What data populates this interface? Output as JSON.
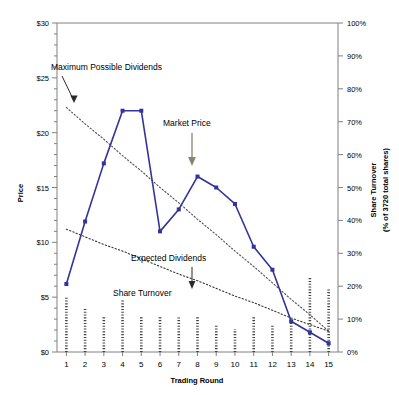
{
  "chart_data": {
    "type": "line",
    "title": "",
    "xlabel": "Trading Round",
    "ylabel": "Price",
    "y2label_line1": "Share Turnover",
    "y2label_line2": "(% of 3720 total shares)",
    "x": [
      1,
      2,
      3,
      4,
      5,
      6,
      7,
      8,
      9,
      10,
      11,
      12,
      13,
      14,
      15
    ],
    "xtick_labels": [
      "1",
      "2",
      "3",
      "4",
      "5",
      "6",
      "7",
      "8",
      "9",
      "10",
      "11",
      "12",
      "13",
      "14",
      "15"
    ],
    "ylim": [
      0,
      30
    ],
    "ytick_labels": [
      "$0",
      "$5",
      "$10",
      "$15",
      "$20",
      "$25",
      "$30"
    ],
    "ytick_values": [
      0,
      5,
      10,
      15,
      20,
      25,
      30
    ],
    "y_minor_step": 1,
    "y2lim": [
      0,
      100
    ],
    "y2tick_labels": [
      "0%",
      "10%",
      "20%",
      "30%",
      "40%",
      "50%",
      "60%",
      "70%",
      "80%",
      "90%",
      "100%"
    ],
    "y2tick_values": [
      0,
      10,
      20,
      30,
      40,
      50,
      60,
      70,
      80,
      90,
      100
    ],
    "grid": false,
    "legend": "none",
    "series": [
      {
        "name": "Market Price",
        "style": "line-markers",
        "axis": "left",
        "color": "#33339a",
        "values": [
          6.2,
          11.9,
          17.2,
          22.0,
          22.0,
          11.0,
          13.0,
          16.0,
          15.0,
          13.5,
          9.6,
          7.5,
          2.8,
          1.8,
          0.8
        ]
      },
      {
        "name": "Maximum Possible Dividends",
        "style": "dotted-trend",
        "axis": "left",
        "color": "#4d4d4d",
        "values": [
          22.3,
          20.8,
          19.4,
          17.9,
          16.5,
          15.0,
          13.6,
          12.1,
          10.7,
          9.2,
          7.8,
          6.3,
          4.8,
          3.4,
          1.9
        ]
      },
      {
        "name": "Expected Dividends",
        "style": "dotted-trend",
        "axis": "left",
        "color": "#333333",
        "values": [
          11.2,
          10.5,
          9.8,
          9.2,
          8.5,
          7.8,
          7.1,
          6.5,
          5.8,
          5.1,
          4.5,
          3.8,
          3.1,
          2.5,
          1.9
        ]
      },
      {
        "name": "Share Turnover",
        "style": "dotted-bar",
        "axis": "right",
        "color": "#444444",
        "values": [
          16.8,
          13.2,
          11.0,
          16.2,
          11.0,
          11.0,
          10.5,
          11.0,
          8.5,
          7.0,
          11.0,
          8.0,
          9.0,
          22.5,
          19.0
        ]
      }
    ],
    "annotations": [
      {
        "id": "max-possible-dividends",
        "label": "Maximum Possible Dividends"
      },
      {
        "id": "market-price",
        "label": "Market Price"
      },
      {
        "id": "expected-dividends",
        "label": "Expected Dividends"
      },
      {
        "id": "share-turnover",
        "label": "Share Turnover"
      }
    ]
  }
}
